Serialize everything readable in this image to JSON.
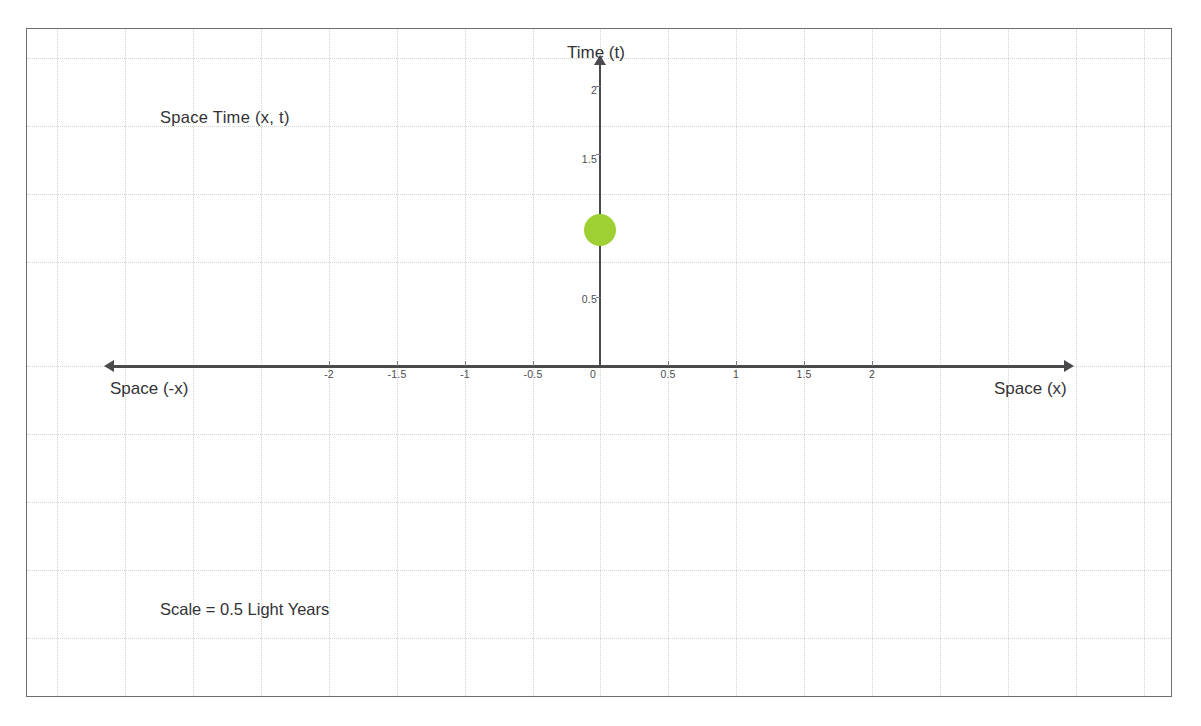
{
  "diagram": {
    "title_annotation": "Space Time (x, t)",
    "scale_annotation": "Scale = 0.5 Light Years",
    "axis_labels": {
      "vertical": "Time (t)",
      "horizontal_negative": "Space (-x)",
      "horizontal_positive": "Space (x)"
    },
    "colors": {
      "event_marker": "#9fd033",
      "axis": "#4a4a4d",
      "grid": "#d3d3d6",
      "frame": "#6f6f70",
      "text": "#333336"
    }
  },
  "chart_data": {
    "type": "scatter",
    "title": "Space Time (x, t)",
    "xlabel": "Space (x)",
    "ylabel": "Time (t)",
    "xlim": [
      -2.5,
      2.5
    ],
    "ylim": [
      0,
      2.2
    ],
    "grid": true,
    "legend": null,
    "xticks": [
      -2,
      -1.5,
      -1,
      -0.5,
      0,
      0.5,
      1,
      1.5,
      2
    ],
    "xticklabels": [
      "-2",
      "-1.5",
      "-1",
      "-0.5",
      "0",
      "0.5",
      "1",
      "1.5",
      "2"
    ],
    "yticks": [
      0.5,
      1,
      1.5,
      2
    ],
    "yticklabels": [
      "0.5",
      "1",
      "1.5",
      "2"
    ],
    "origin_label": "0",
    "series": [
      {
        "name": "event",
        "points": [
          {
            "x": 0,
            "y": 1
          }
        ],
        "color": "#9fd033",
        "marker": "circle",
        "marker_size_px": 32
      }
    ],
    "annotations": [
      {
        "text": "Space Time (x, t)",
        "x": -1.95,
        "y": 1.83
      },
      {
        "text": "Scale = 0.5 Light Years",
        "x": -1.95,
        "y": -1.45
      }
    ]
  },
  "axis_geometry": {
    "x_ticks_px": [
      329,
      397,
      465,
      533,
      600,
      668,
      736,
      804,
      872
    ],
    "y_ticks_px": [
      297,
      226,
      154,
      86
    ],
    "grid_v_px": [
      57,
      125,
      193,
      261,
      329,
      397,
      465,
      533,
      600,
      668,
      736,
      804,
      872,
      940,
      1008,
      1076,
      1144
    ],
    "grid_h_px": [
      57,
      125,
      193,
      261,
      338,
      406,
      474,
      542,
      610
    ]
  }
}
